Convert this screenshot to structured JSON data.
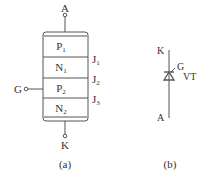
{
  "diagram_a": {
    "terminals": {
      "anode": "A",
      "cathode": "K",
      "gate": "G"
    },
    "layers": [
      {
        "base": "P",
        "sub": "1"
      },
      {
        "base": "N",
        "sub": "1"
      },
      {
        "base": "P",
        "sub": "2"
      },
      {
        "base": "N",
        "sub": "2"
      }
    ],
    "junctions": [
      {
        "base": "J",
        "sub": "1"
      },
      {
        "base": "J",
        "sub": "2"
      },
      {
        "base": "J",
        "sub": "3"
      }
    ],
    "caption": "(a)"
  },
  "diagram_b": {
    "terminals": {
      "cathode": "K",
      "anode": "A",
      "gate": "G"
    },
    "device_label": "VT",
    "caption": "(b)"
  },
  "colors": {
    "line": "#555555",
    "text": "#333333"
  }
}
